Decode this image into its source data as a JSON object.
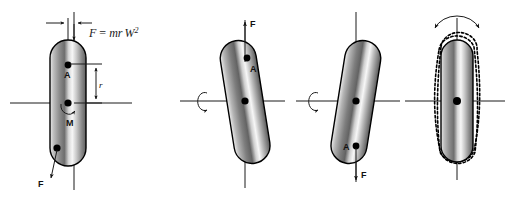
{
  "figure": {
    "background_color": "#ffffff",
    "ink_color": "#1a1a1a",
    "body_fill_light": "#f2f2f2",
    "body_fill_mid": "#9a9a9a",
    "body_fill_dark": "#4d4d4d",
    "panel_count": 4
  },
  "formula": {
    "lhs": "F",
    "equals": "=",
    "rhs_mr": "mr",
    "rhs_w": "W",
    "rhs_exp": "2",
    "full_text": "F = mr W2"
  },
  "panels": [
    {
      "id": "panel-1",
      "name": "static-unbalance",
      "tilt_deg": 0,
      "labels": {
        "point_a": "A",
        "mass_m": "M",
        "radius_r": "r",
        "force_f": "F"
      },
      "annotations": {
        "eccentricity_arrows": "inward-horizontal-pair",
        "radius_dimension": "double-headed-vertical",
        "force_direction": "down-left",
        "moment_symbol": "curved-hook-arrow"
      }
    },
    {
      "id": "panel-2",
      "name": "couple-unbalance-tilt-right",
      "tilt_deg": -9,
      "labels": {
        "point_a": "A",
        "force_f": "F"
      },
      "annotations": {
        "rotation_symbol": "loop-arrow-counterclockwise",
        "force_direction": "up"
      }
    },
    {
      "id": "panel-3",
      "name": "couple-unbalance-tilt-left",
      "tilt_deg": 9,
      "labels": {
        "point_a": "A",
        "force_f": "F"
      },
      "annotations": {
        "rotation_symbol": "loop-arrow-counterclockwise",
        "force_direction": "down"
      }
    },
    {
      "id": "panel-4",
      "name": "rocking-couple-whirl",
      "tilt_deg": 0,
      "labels": {},
      "annotations": {
        "rocking_arrow": "double-headed-arc",
        "ghost_outlines": 2,
        "ghost_style": "dotted"
      }
    }
  ]
}
